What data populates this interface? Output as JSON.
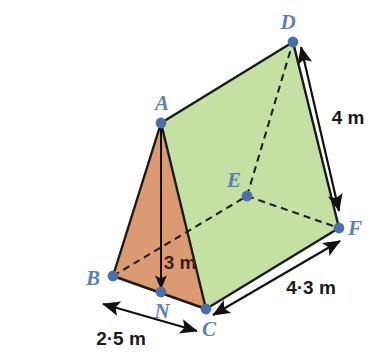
{
  "figure": {
    "kind": "triangular-prism",
    "background": "#ffffff"
  },
  "colors": {
    "face_green": "#c5e0a3",
    "face_orange": "#dc9a72",
    "vertex_dot": "#4a6fa8",
    "vertex_label": "#5b7fb8",
    "edge": "#1a1a1a",
    "dashed_edge": "#1c1c1c",
    "dimension_line": "#111111",
    "height_label": "#3b1f14"
  },
  "vertices": [
    {
      "id": "A",
      "label": "A",
      "x": 161,
      "y": 123,
      "label_x": 162,
      "label_y": 103
    },
    {
      "id": "B",
      "label": "B",
      "x": 113,
      "y": 276,
      "label_x": 93,
      "label_y": 278
    },
    {
      "id": "C",
      "label": "C",
      "x": 206,
      "y": 309,
      "label_x": 209,
      "label_y": 329
    },
    {
      "id": "D",
      "label": "D",
      "x": 293,
      "y": 42,
      "label_x": 288,
      "label_y": 22
    },
    {
      "id": "E",
      "label": "E",
      "x": 247,
      "y": 196,
      "label_x": 234,
      "label_y": 180
    },
    {
      "id": "F",
      "label": "F",
      "x": 339,
      "y": 228,
      "label_x": 355,
      "label_y": 228
    },
    {
      "id": "N",
      "label": "N",
      "x": 161,
      "y": 292,
      "label_x": 162,
      "label_y": 311
    }
  ],
  "faces": [
    {
      "id": "roof-face-ADFC",
      "points": "161,123 293,42 339,228 206,309",
      "fill": "#c5e0a3"
    },
    {
      "id": "front-face-ABC",
      "points": "161,123 113,276 206,309",
      "fill": "#dc9a72"
    }
  ],
  "solid_edges": [
    {
      "id": "edge-A-D",
      "x1": 161,
      "y1": 123,
      "x2": 293,
      "y2": 42
    },
    {
      "id": "edge-A-B",
      "x1": 161,
      "y1": 123,
      "x2": 113,
      "y2": 276
    },
    {
      "id": "edge-A-C",
      "x1": 161,
      "y1": 123,
      "x2": 206,
      "y2": 309
    },
    {
      "id": "edge-B-C",
      "x1": 113,
      "y1": 276,
      "x2": 206,
      "y2": 309
    },
    {
      "id": "edge-C-F",
      "x1": 206,
      "y1": 309,
      "x2": 339,
      "y2": 228
    },
    {
      "id": "edge-D-F",
      "x1": 293,
      "y1": 42,
      "x2": 339,
      "y2": 228
    }
  ],
  "dashed_edges": [
    {
      "id": "hidden-edge-B-E",
      "x1": 113,
      "y1": 276,
      "x2": 247,
      "y2": 196
    },
    {
      "id": "hidden-edge-E-D",
      "x1": 247,
      "y1": 196,
      "x2": 293,
      "y2": 42
    },
    {
      "id": "hidden-edge-E-F",
      "x1": 247,
      "y1": 196,
      "x2": 339,
      "y2": 228
    }
  ],
  "dimensions": [
    {
      "id": "height-AN",
      "label": "3 m",
      "value": 3,
      "unit": "m",
      "style": "single-arrow",
      "label_x": 180,
      "label_y": 262,
      "x1": 161,
      "y1": 126,
      "x2": 161,
      "y2": 289
    },
    {
      "id": "length-DF",
      "label": "4 m",
      "value": 4,
      "unit": "m",
      "style": "double-arrow",
      "label_x": 348,
      "label_y": 117,
      "x1": 301,
      "y1": 47,
      "x2": 339,
      "y2": 211
    },
    {
      "id": "length-CF",
      "label": "4·3 m",
      "value": 4.3,
      "unit": "m",
      "style": "double-arrow",
      "label_x": 311,
      "label_y": 287,
      "x1": 213,
      "y1": 315,
      "x2": 340,
      "y2": 241
    },
    {
      "id": "width-BC",
      "label": "2·5 m",
      "value": 2.5,
      "unit": "m",
      "style": "double-arrow",
      "label_x": 121,
      "label_y": 338,
      "x1": 103,
      "y1": 304,
      "x2": 197,
      "y2": 331
    }
  ]
}
